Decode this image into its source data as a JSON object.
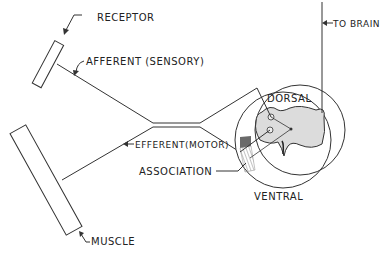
{
  "diagram": {
    "type": "reflex-arc",
    "labels": {
      "receptor": "RECEPTOR",
      "afferent": "AFFERENT (SENSORY)",
      "efferent": "EFFERENT(MOTOR)",
      "association": "ASSOCIATION",
      "dorsal": "DORSAL",
      "ventral": "VENTRAL",
      "to_brain": "TO BRAIN",
      "muscle": "MUSCLE"
    },
    "colors": {
      "line": "#333333",
      "gray_matter": "#dcdcdc",
      "hatch_dark": "#6a6a6a",
      "hatch_light": "#b8b8b8"
    }
  }
}
